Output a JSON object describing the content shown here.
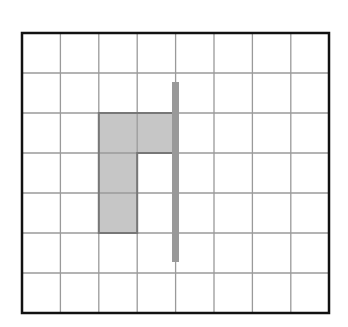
{
  "diagram": {
    "type": "grid-figure",
    "grid": {
      "columns": 8,
      "rows": 7,
      "cell_width": 38.4,
      "cell_height": 40,
      "line_color": "#9a9a9a",
      "border_color": "#111111"
    },
    "shaded_shape": {
      "description": "L-shaped (flag-like) figure made of 4 grid cells",
      "cells": [
        [
          2,
          2
        ],
        [
          3,
          2
        ],
        [
          2,
          3
        ],
        [
          2,
          4
        ]
      ],
      "fill": "#c6c6c6",
      "outline": "#777777"
    },
    "line_of_symmetry": {
      "description": "vertical mirror line",
      "x": 174,
      "y_from": 82,
      "y_to": 262,
      "width": 7,
      "color": "#999999"
    }
  }
}
